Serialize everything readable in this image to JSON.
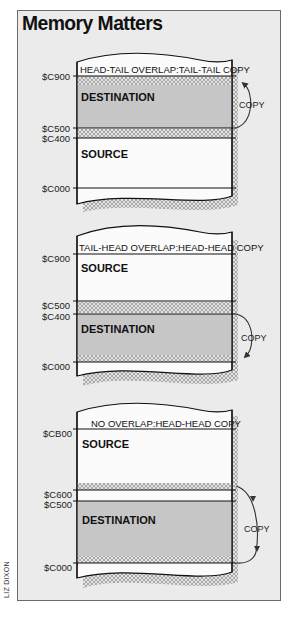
{
  "title": "Memory Matters",
  "credit": "LIZ DIXON",
  "colors": {
    "frame_bg": "#ebebeb",
    "destination_fill": "#c6c6c6",
    "source_fill": "#f7f7f7",
    "hatch": "#9a9a9a",
    "ink": "#111111"
  },
  "sections": [
    {
      "caption": "HEAD-TAIL OVERLAP:TAIL-TAIL COPY",
      "addresses": [
        "$C900",
        "$C500",
        "$C400",
        "$C000"
      ],
      "top_block": "DESTINATION",
      "bottom_block": "SOURCE",
      "arrow_label": "COPY",
      "arrow_direction": "up"
    },
    {
      "caption": "TAIL-HEAD OVERLAP:HEAD-HEAD COPY",
      "addresses": [
        "$C900",
        "$C500",
        "$C400",
        "$C000"
      ],
      "top_block": "SOURCE",
      "bottom_block": "DESTINATION",
      "arrow_label": "COPY",
      "arrow_direction": "down"
    },
    {
      "caption": "NO OVERLAP:HEAD-HEAD COPY",
      "addresses": [
        "$CB00",
        "$C600",
        "$C500",
        "$C000"
      ],
      "top_block": "SOURCE",
      "bottom_block": "DESTINATION",
      "arrow_label": "COPY",
      "arrow_direction": "down"
    }
  ]
}
